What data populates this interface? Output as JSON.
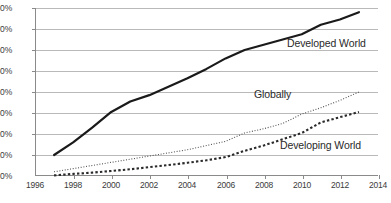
{
  "chart_data": {
    "type": "line",
    "title": "",
    "subtitle": "",
    "xlabel": "",
    "ylabel": "",
    "xlim": [
      1996,
      2014
    ],
    "ylim": [
      0,
      80
    ],
    "grid": true,
    "legend_position": "inline-annotations",
    "x_ticks": [
      "1996",
      "1998",
      "2000",
      "2002",
      "2004",
      "2006",
      "2008",
      "2010",
      "2012",
      "2014"
    ],
    "y_ticks": [
      "0%",
      "10%",
      "20%",
      "30%",
      "40%",
      "50%",
      "60%",
      "70%",
      "80%"
    ],
    "x": [
      1997,
      1998,
      1999,
      2000,
      2001,
      2002,
      2003,
      2004,
      2005,
      2006,
      2007,
      2008,
      2009,
      2010,
      2011,
      2012,
      2013
    ],
    "series": [
      {
        "name": "Developed World",
        "style": "solid",
        "color": "#1a1a1a",
        "values": [
          10.0,
          16.0,
          23.0,
          30.5,
          35.5,
          38.5,
          42.5,
          46.5,
          51.0,
          56.0,
          60.0,
          62.5,
          65.0,
          67.5,
          72.0,
          74.5,
          78.0
        ]
      },
      {
        "name": "Globally",
        "style": "dotted",
        "color": "#555555",
        "values": [
          2.0,
          3.5,
          5.0,
          6.5,
          8.0,
          9.5,
          11.0,
          12.5,
          14.5,
          16.5,
          20.5,
          22.5,
          25.0,
          29.5,
          32.5,
          36.0,
          40.0
        ]
      },
      {
        "name": "Developing World",
        "style": "dashed",
        "color": "#2a2a2a",
        "values": [
          0.3,
          1.0,
          1.6,
          2.4,
          3.2,
          4.2,
          5.2,
          6.3,
          7.5,
          9.0,
          12.0,
          14.5,
          17.5,
          20.5,
          25.5,
          28.0,
          30.5
        ]
      }
    ],
    "annotations": [
      {
        "text": "Developed World",
        "x_px": 287,
        "y_px": 44
      },
      {
        "text": "Globally",
        "x_px": 254,
        "y_px": 95
      },
      {
        "text": "Developing World",
        "x_px": 280,
        "y_px": 146
      }
    ]
  },
  "axis": {
    "y_labels": [
      "80%",
      "70%",
      "60%",
      "50%",
      "40%",
      "30%",
      "20%",
      "10%",
      "0%"
    ],
    "x_labels": [
      "1996",
      "1998",
      "2000",
      "2002",
      "2004",
      "2006",
      "2008",
      "2010",
      "2012",
      "2014"
    ]
  },
  "colors": {
    "axis": "#8a8a8a",
    "grid": "#b9b9b9",
    "developed": "#1a1a1a",
    "globally": "#555555",
    "developing": "#2a2a2a",
    "text": "#3b3b3b",
    "background": "#ffffff"
  }
}
